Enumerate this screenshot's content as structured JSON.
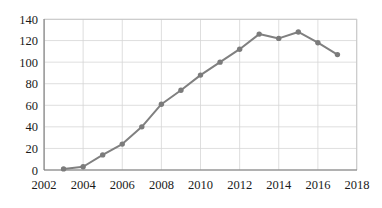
{
  "chart_data": {
    "type": "line",
    "title": "",
    "subtitle": "",
    "xlabel": "",
    "ylabel": "",
    "xlim": [
      2002,
      2018
    ],
    "ylim": [
      0,
      140
    ],
    "grid": true,
    "legend": null,
    "legend_position": "none",
    "x_tick_labels": [
      "2002",
      "2004",
      "2006",
      "2008",
      "2010",
      "2012",
      "2014",
      "2016",
      "2018"
    ],
    "x_ticks": [
      2002,
      2004,
      2006,
      2008,
      2010,
      2012,
      2014,
      2016,
      2018
    ],
    "y_tick_labels": [
      "0",
      "20",
      "40",
      "60",
      "80",
      "100",
      "120",
      "140"
    ],
    "y_ticks": [
      0,
      20,
      40,
      60,
      80,
      100,
      120,
      140
    ],
    "x": [
      2003,
      2004,
      2005,
      2006,
      2007,
      2008,
      2009,
      2010,
      2011,
      2012,
      2013,
      2014,
      2015,
      2016,
      2017
    ],
    "values": [
      1,
      3,
      14,
      24,
      40,
      61,
      74,
      88,
      100,
      112,
      126,
      122,
      128,
      118,
      107
    ],
    "series": [
      {
        "name": "series-1",
        "color": "#808080",
        "marker": "circle",
        "x": [
          2003,
          2004,
          2005,
          2006,
          2007,
          2008,
          2009,
          2010,
          2011,
          2012,
          2013,
          2014,
          2015,
          2016,
          2017
        ],
        "values": [
          1,
          3,
          14,
          24,
          40,
          61,
          74,
          88,
          100,
          112,
          126,
          122,
          128,
          118,
          107
        ]
      }
    ]
  },
  "colors": {
    "series": "#808080",
    "marker": "#7b7b7b",
    "grid": "#d6d6d6",
    "axis": "#7d7d7d",
    "frame": "#c9c9c9",
    "text": "#1a1a1a",
    "background": "#ffffff"
  }
}
